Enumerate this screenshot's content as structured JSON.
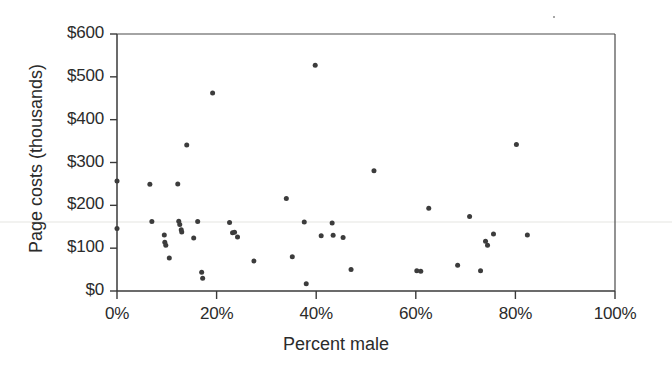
{
  "chart_data": {
    "type": "scatter",
    "title": "",
    "xlabel": "Percent male",
    "ylabel": "Page costs (thousands)",
    "xlim": [
      0,
      100
    ],
    "ylim": [
      0,
      600
    ],
    "grid": false,
    "legend": null,
    "x_tick_labels": [
      "0%",
      "20%",
      "40%",
      "60%",
      "80%",
      "100%"
    ],
    "x_tick_values": [
      0,
      20,
      40,
      60,
      80,
      100
    ],
    "y_tick_labels": [
      "$600",
      "$500",
      "$400",
      "$300",
      "$200",
      "$100",
      "$0"
    ],
    "y_tick_values": [
      600,
      500,
      400,
      300,
      200,
      100,
      0
    ],
    "x_unit": "percent",
    "y_unit": "thousands of dollars",
    "marker": {
      "shape": "circle",
      "color": "#3c3c3c",
      "size": 5
    },
    "point_count": 55,
    "points": [
      {
        "x": 0.0,
        "y": 257
      },
      {
        "x": 0.0,
        "y": 146
      },
      {
        "x": 6.6,
        "y": 249
      },
      {
        "x": 7.0,
        "y": 162
      },
      {
        "x": 9.5,
        "y": 131
      },
      {
        "x": 9.6,
        "y": 114
      },
      {
        "x": 9.8,
        "y": 107
      },
      {
        "x": 10.5,
        "y": 77
      },
      {
        "x": 12.2,
        "y": 250
      },
      {
        "x": 12.4,
        "y": 163
      },
      {
        "x": 12.6,
        "y": 155
      },
      {
        "x": 12.9,
        "y": 143
      },
      {
        "x": 13.0,
        "y": 138
      },
      {
        "x": 14.0,
        "y": 341
      },
      {
        "x": 15.4,
        "y": 124
      },
      {
        "x": 16.2,
        "y": 162
      },
      {
        "x": 17.0,
        "y": 44
      },
      {
        "x": 17.2,
        "y": 30
      },
      {
        "x": 19.2,
        "y": 462
      },
      {
        "x": 22.6,
        "y": 160
      },
      {
        "x": 23.2,
        "y": 136
      },
      {
        "x": 23.6,
        "y": 137
      },
      {
        "x": 24.2,
        "y": 126
      },
      {
        "x": 27.5,
        "y": 70
      },
      {
        "x": 34.0,
        "y": 216
      },
      {
        "x": 35.2,
        "y": 80
      },
      {
        "x": 37.6,
        "y": 161
      },
      {
        "x": 38.0,
        "y": 17
      },
      {
        "x": 39.8,
        "y": 527
      },
      {
        "x": 41.0,
        "y": 129
      },
      {
        "x": 43.2,
        "y": 159
      },
      {
        "x": 43.4,
        "y": 130
      },
      {
        "x": 45.4,
        "y": 125
      },
      {
        "x": 47.0,
        "y": 50
      },
      {
        "x": 51.6,
        "y": 281
      },
      {
        "x": 60.2,
        "y": 47
      },
      {
        "x": 61.0,
        "y": 46
      },
      {
        "x": 62.6,
        "y": 193
      },
      {
        "x": 68.4,
        "y": 60
      },
      {
        "x": 70.8,
        "y": 174
      },
      {
        "x": 73.0,
        "y": 47
      },
      {
        "x": 74.0,
        "y": 116
      },
      {
        "x": 74.4,
        "y": 107
      },
      {
        "x": 75.6,
        "y": 133
      },
      {
        "x": 80.2,
        "y": 342
      },
      {
        "x": 82.4,
        "y": 131
      }
    ]
  },
  "figure": {
    "axis_color": "#3a3a3a",
    "point_color": "#3c3c3c",
    "background": "#ffffff"
  }
}
